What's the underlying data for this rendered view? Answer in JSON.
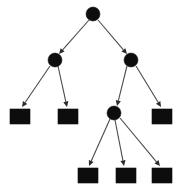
{
  "diagram": {
    "type": "rooted-tree",
    "background_color": "#ffffff",
    "node_color": "#0d0d0d",
    "edge_color": "#4a4a4a",
    "canvas": {
      "width": 180,
      "height": 194
    }
  },
  "chart_data": {
    "type": "diagram",
    "xlabel": "",
    "ylabel": "",
    "legend": [],
    "nodes": [
      {
        "id": "n0",
        "shape": "circle",
        "label": "",
        "cx": 93,
        "cy": 14,
        "r": 7,
        "level": 0
      },
      {
        "id": "n1",
        "shape": "circle",
        "label": "",
        "cx": 55,
        "cy": 60,
        "r": 7,
        "level": 1
      },
      {
        "id": "n2",
        "shape": "circle",
        "label": "",
        "cx": 131,
        "cy": 60,
        "r": 7,
        "level": 1
      },
      {
        "id": "n3",
        "shape": "square",
        "label": "",
        "x": 10,
        "y": 109,
        "w": 20,
        "h": 15,
        "level": 2
      },
      {
        "id": "n4",
        "shape": "square",
        "label": "",
        "x": 58,
        "y": 109,
        "w": 20,
        "h": 15,
        "level": 2
      },
      {
        "id": "n5",
        "shape": "circle",
        "label": "",
        "cx": 114,
        "cy": 113,
        "r": 7,
        "level": 2
      },
      {
        "id": "n6",
        "shape": "square",
        "label": "",
        "x": 152,
        "y": 109,
        "w": 20,
        "h": 15,
        "level": 2
      },
      {
        "id": "n7",
        "shape": "square",
        "label": "",
        "x": 78,
        "y": 168,
        "w": 20,
        "h": 15,
        "level": 3
      },
      {
        "id": "n8",
        "shape": "square",
        "label": "",
        "x": 116,
        "y": 168,
        "w": 20,
        "h": 15,
        "level": 3
      },
      {
        "id": "n9",
        "shape": "square",
        "label": "",
        "x": 152,
        "y": 168,
        "w": 20,
        "h": 15,
        "level": 3
      }
    ],
    "edges": [
      {
        "from": "n0",
        "to": "n1",
        "x1": 89,
        "y1": 20,
        "x2": 59,
        "y2": 54,
        "directed": true
      },
      {
        "from": "n0",
        "to": "n2",
        "x1": 98,
        "y1": 20,
        "x2": 127,
        "y2": 54,
        "directed": true
      },
      {
        "from": "n1",
        "to": "n3",
        "x1": 50,
        "y1": 66,
        "x2": 22,
        "y2": 107,
        "directed": true
      },
      {
        "from": "n1",
        "to": "n4",
        "x1": 58,
        "y1": 66,
        "x2": 67,
        "y2": 107,
        "directed": true
      },
      {
        "from": "n2",
        "to": "n5",
        "x1": 127,
        "y1": 66,
        "x2": 117,
        "y2": 106,
        "directed": true
      },
      {
        "from": "n2",
        "to": "n6",
        "x1": 136,
        "y1": 66,
        "x2": 161,
        "y2": 107,
        "directed": true
      },
      {
        "from": "n5",
        "to": "n7",
        "x1": 110,
        "y1": 119,
        "x2": 89,
        "y2": 166,
        "directed": true
      },
      {
        "from": "n5",
        "to": "n8",
        "x1": 115,
        "y1": 120,
        "x2": 124,
        "y2": 166,
        "directed": true
      },
      {
        "from": "n5",
        "to": "n9",
        "x1": 120,
        "y1": 118,
        "x2": 160,
        "y2": 166,
        "directed": true
      }
    ],
    "node_count": 10,
    "edge_count": 9,
    "internal_node_count": 4,
    "leaf_node_count": 6,
    "depth": 3
  }
}
